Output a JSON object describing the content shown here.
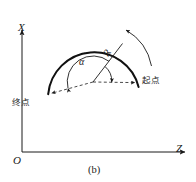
{
  "figure": {
    "caption": "(b)",
    "axes": {
      "vertical_label": "X",
      "horizontal_label": "Z",
      "origin_label": "O"
    },
    "annotations": {
      "start_point_label": "起点",
      "end_point_label": "终点",
      "angle_label": "α",
      "radius_label": "R"
    },
    "colors": {
      "stroke": "#1a1a1a",
      "dashed": "#555555",
      "background": "#ffffff"
    },
    "geometry": {
      "circle_center_x": 93,
      "circle_center_y": 82,
      "circle_radius": 46,
      "solid_arc_description": "upper arc from end-point to start-point",
      "dashed_arc_description": "lower arc from start-point to end-point",
      "rotation_arrow": "counterclockwise-outside-upper-right"
    }
  }
}
